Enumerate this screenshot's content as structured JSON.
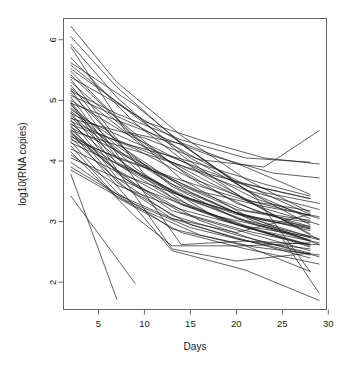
{
  "chart_data": {
    "type": "line",
    "title": "",
    "xlabel": "Days",
    "ylabel": "log10(RNA copies)",
    "xlim": [
      1.2,
      29.8
    ],
    "ylim": [
      1.55,
      6.35
    ],
    "xticks": [
      5,
      10,
      15,
      20,
      25,
      30
    ],
    "yticks": [
      2,
      3,
      4,
      5,
      6
    ],
    "xtick_labels": [
      "5",
      "10",
      "15",
      "20",
      "25",
      "30"
    ],
    "ytick_labels": [
      "2",
      "3",
      "4",
      "5",
      "6"
    ],
    "grid": false,
    "legend": "none",
    "series": [
      {
        "name": "s1",
        "x": [
          2,
          7,
          14,
          21,
          28
        ],
        "values": [
          6.22,
          5.3,
          4.42,
          3.7,
          3.15
        ]
      },
      {
        "name": "s2",
        "x": [
          2,
          7,
          14,
          21,
          28
        ],
        "values": [
          6.05,
          5.22,
          4.28,
          3.52,
          2.95
        ]
      },
      {
        "name": "s3",
        "x": [
          2,
          7,
          14,
          21,
          28
        ],
        "values": [
          5.92,
          5.05,
          4.1,
          3.35,
          2.8
        ]
      },
      {
        "name": "s4",
        "x": [
          2,
          9,
          16,
          23,
          29
        ],
        "values": [
          5.7,
          4.62,
          3.8,
          3.2,
          2.7
        ]
      },
      {
        "name": "s5",
        "x": [
          2,
          8,
          15,
          22,
          28
        ],
        "values": [
          5.58,
          4.85,
          4.05,
          3.45,
          3.05
        ]
      },
      {
        "name": "s6",
        "x": [
          2,
          7,
          13,
          20,
          28
        ],
        "values": [
          5.48,
          4.7,
          3.95,
          3.3,
          2.88
        ]
      },
      {
        "name": "s7",
        "x": [
          2,
          9,
          16,
          22,
          28
        ],
        "values": [
          5.42,
          4.4,
          3.62,
          3.18,
          2.92
        ]
      },
      {
        "name": "s8",
        "x": [
          2,
          7,
          14,
          21,
          28
        ],
        "values": [
          5.38,
          4.95,
          4.3,
          3.9,
          3.45
        ]
      },
      {
        "name": "s9",
        "x": [
          2,
          8,
          14,
          21,
          29
        ],
        "values": [
          5.3,
          4.52,
          3.7,
          3.1,
          2.62
        ]
      },
      {
        "name": "s10",
        "x": [
          2,
          7,
          13,
          20,
          28
        ],
        "values": [
          5.25,
          4.3,
          3.58,
          3.05,
          2.7
        ]
      },
      {
        "name": "s11",
        "x": [
          2,
          10,
          17,
          23,
          29
        ],
        "values": [
          5.2,
          4.22,
          3.65,
          3.22,
          2.95
        ]
      },
      {
        "name": "s12",
        "x": [
          2,
          7,
          14,
          21,
          28
        ],
        "values": [
          5.15,
          4.78,
          4.35,
          4.05,
          3.98
        ]
      },
      {
        "name": "s13",
        "x": [
          2,
          8,
          15,
          22,
          28
        ],
        "values": [
          5.12,
          4.18,
          3.48,
          3.0,
          2.68
        ]
      },
      {
        "name": "s14",
        "x": [
          2,
          9,
          15,
          21,
          28
        ],
        "values": [
          5.08,
          4.6,
          4.1,
          3.6,
          3.12
        ]
      },
      {
        "name": "s15",
        "x": [
          2,
          7,
          13,
          20,
          28
        ],
        "values": [
          5.05,
          4.05,
          3.4,
          2.95,
          2.62
        ]
      },
      {
        "name": "s16",
        "x": [
          2,
          8,
          16,
          22,
          29
        ],
        "values": [
          5.0,
          4.45,
          3.85,
          3.38,
          3.05
        ]
      },
      {
        "name": "s17",
        "x": [
          2,
          7,
          14,
          21,
          28
        ],
        "values": [
          4.98,
          3.95,
          3.3,
          2.92,
          2.58
        ]
      },
      {
        "name": "s18",
        "x": [
          2,
          10,
          17,
          24,
          29
        ],
        "values": [
          4.95,
          4.5,
          4.1,
          3.8,
          3.72
        ]
      },
      {
        "name": "s19",
        "x": [
          2,
          7,
          13,
          20,
          28
        ],
        "values": [
          4.92,
          4.25,
          3.62,
          3.15,
          2.85
        ]
      },
      {
        "name": "s20",
        "x": [
          2,
          9,
          15,
          22,
          28
        ],
        "values": [
          4.88,
          3.88,
          3.25,
          2.88,
          2.6
        ]
      },
      {
        "name": "s21",
        "x": [
          2,
          7,
          14,
          21,
          29
        ],
        "values": [
          4.85,
          4.35,
          3.92,
          3.52,
          3.2
        ]
      },
      {
        "name": "s22",
        "x": [
          2,
          8,
          14,
          21,
          28
        ],
        "values": [
          4.82,
          4.08,
          3.52,
          3.08,
          2.75
        ]
      },
      {
        "name": "s23",
        "x": [
          2,
          7,
          13,
          21,
          28
        ],
        "values": [
          4.8,
          3.8,
          3.18,
          2.82,
          2.52
        ]
      },
      {
        "name": "s24",
        "x": [
          2,
          9,
          16,
          23,
          29
        ],
        "values": [
          4.78,
          4.3,
          3.88,
          3.48,
          3.3
        ]
      },
      {
        "name": "s25",
        "x": [
          2,
          7,
          14,
          20,
          28
        ],
        "values": [
          4.75,
          4.15,
          3.6,
          3.2,
          2.98
        ]
      },
      {
        "name": "s26",
        "x": [
          2,
          8,
          15,
          22,
          28
        ],
        "values": [
          4.72,
          3.92,
          3.35,
          2.95,
          2.68
        ]
      },
      {
        "name": "s27",
        "x": [
          2,
          10,
          16,
          23,
          29
        ],
        "values": [
          4.7,
          4.38,
          4.02,
          3.9,
          4.5
        ]
      },
      {
        "name": "s28",
        "x": [
          2,
          7,
          13,
          20,
          28
        ],
        "values": [
          4.68,
          3.72,
          3.1,
          2.78,
          2.48
        ]
      },
      {
        "name": "s29",
        "x": [
          2,
          9,
          15,
          22,
          28
        ],
        "values": [
          4.65,
          4.2,
          3.72,
          3.32,
          3.1
        ]
      },
      {
        "name": "s30",
        "x": [
          2,
          7,
          14,
          21,
          29
        ],
        "values": [
          4.62,
          3.98,
          3.42,
          3.02,
          2.72
        ]
      },
      {
        "name": "s31",
        "x": [
          2,
          8,
          16,
          23,
          28
        ],
        "values": [
          4.6,
          4.28,
          3.95,
          3.62,
          3.42
        ]
      },
      {
        "name": "s32",
        "x": [
          2,
          7,
          13,
          20,
          28
        ],
        "values": [
          4.58,
          3.65,
          3.05,
          2.72,
          2.45
        ]
      },
      {
        "name": "s33",
        "x": [
          2,
          9,
          15,
          21,
          28
        ],
        "values": [
          4.55,
          4.02,
          3.55,
          3.18,
          3.02
        ]
      },
      {
        "name": "s34",
        "x": [
          2,
          7,
          14,
          21,
          29
        ],
        "values": [
          4.52,
          3.85,
          3.28,
          2.9,
          2.65
        ]
      },
      {
        "name": "s35",
        "x": [
          2,
          10,
          17,
          23,
          28
        ],
        "values": [
          4.5,
          4.12,
          3.78,
          3.55,
          3.38
        ]
      },
      {
        "name": "s36",
        "x": [
          2,
          8,
          14,
          21,
          28
        ],
        "values": [
          4.48,
          3.7,
          3.15,
          2.85,
          2.62
        ]
      },
      {
        "name": "s37",
        "x": [
          2,
          7,
          13,
          20,
          28
        ],
        "values": [
          4.45,
          3.95,
          3.48,
          3.12,
          2.92
        ]
      },
      {
        "name": "s38",
        "x": [
          2,
          9,
          16,
          22,
          29
        ],
        "values": [
          4.42,
          3.62,
          3.02,
          2.7,
          2.42
        ]
      },
      {
        "name": "s39",
        "x": [
          2,
          7,
          14,
          21,
          28
        ],
        "values": [
          4.4,
          4.05,
          3.68,
          3.35,
          3.18
        ]
      },
      {
        "name": "s40",
        "x": [
          2,
          8,
          15,
          22,
          28
        ],
        "values": [
          4.38,
          3.55,
          2.95,
          2.65,
          2.4
        ]
      },
      {
        "name": "s41",
        "x": [
          2,
          10,
          16,
          23,
          29
        ],
        "values": [
          4.35,
          3.9,
          3.5,
          3.25,
          3.08
        ]
      },
      {
        "name": "s42",
        "x": [
          2,
          7,
          13,
          21,
          28
        ],
        "values": [
          4.32,
          3.48,
          2.88,
          2.6,
          2.18
        ]
      },
      {
        "name": "s43",
        "x": [
          2,
          9,
          15,
          22,
          28
        ],
        "values": [
          4.3,
          3.82,
          3.38,
          3.05,
          2.9
        ]
      },
      {
        "name": "s44",
        "x": [
          2,
          7,
          14,
          21,
          29
        ],
        "values": [
          4.25,
          3.4,
          2.82,
          2.55,
          2.3
        ]
      },
      {
        "name": "s45",
        "x": [
          2,
          8,
          16,
          23,
          28
        ],
        "values": [
          4.2,
          3.75,
          3.32,
          3.02,
          2.88
        ]
      },
      {
        "name": "s46",
        "x": [
          2,
          9,
          13,
          21,
          28
        ],
        "values": [
          4.15,
          3.08,
          2.6,
          2.6,
          2.65
        ]
      },
      {
        "name": "s47",
        "x": [
          2,
          7,
          14,
          20,
          28
        ],
        "values": [
          4.1,
          3.6,
          3.2,
          2.95,
          2.75
        ]
      },
      {
        "name": "s48",
        "x": [
          2,
          10,
          17,
          24,
          29
        ],
        "values": [
          4.05,
          3.52,
          3.12,
          2.88,
          2.7
        ]
      },
      {
        "name": "s49",
        "x": [
          2,
          8,
          15,
          21,
          28
        ],
        "values": [
          3.98,
          3.35,
          2.9,
          2.68,
          2.55
        ]
      },
      {
        "name": "s50",
        "x": [
          2,
          7,
          13,
          20,
          28
        ],
        "values": [
          3.9,
          3.45,
          3.05,
          2.82,
          3.12
        ]
      },
      {
        "name": "s51",
        "x": [
          2,
          9,
          16,
          22,
          29
        ],
        "values": [
          3.85,
          3.25,
          2.78,
          2.58,
          2.45
        ]
      },
      {
        "name": "s52",
        "x": [
          2,
          7
        ],
        "values": [
          3.78,
          1.72
        ]
      },
      {
        "name": "s53",
        "x": [
          2,
          9
        ],
        "values": [
          3.42,
          1.98
        ]
      },
      {
        "name": "s54",
        "x": [
          2,
          13,
          21,
          29
        ],
        "values": [
          4.48,
          2.52,
          2.2,
          1.7
        ]
      },
      {
        "name": "s55",
        "x": [
          2,
          10,
          18,
          25,
          29
        ],
        "values": [
          5.35,
          3.78,
          3.05,
          2.72,
          1.82
        ]
      },
      {
        "name": "s56",
        "x": [
          2,
          9,
          15,
          22,
          28
        ],
        "values": [
          5.62,
          4.92,
          4.18,
          3.42,
          2.18
        ]
      },
      {
        "name": "s57",
        "x": [
          2,
          13,
          20,
          28
        ],
        "values": [
          4.95,
          2.55,
          2.35,
          2.48
        ]
      },
      {
        "name": "s58",
        "x": [
          2,
          14,
          21,
          29
        ],
        "values": [
          5.18,
          2.62,
          2.68,
          2.62
        ]
      },
      {
        "name": "s59",
        "x": [
          2,
          10,
          16,
          23,
          29
        ],
        "values": [
          5.52,
          4.65,
          4.35,
          4.05,
          3.95
        ]
      },
      {
        "name": "s60",
        "x": [
          2,
          8,
          14,
          20,
          28
        ],
        "values": [
          5.88,
          4.48,
          4.28,
          3.65,
          3.38
        ]
      }
    ]
  },
  "axes": {
    "x_axis_name": "days-axis",
    "y_axis_name": "log-rna-copies-axis"
  }
}
